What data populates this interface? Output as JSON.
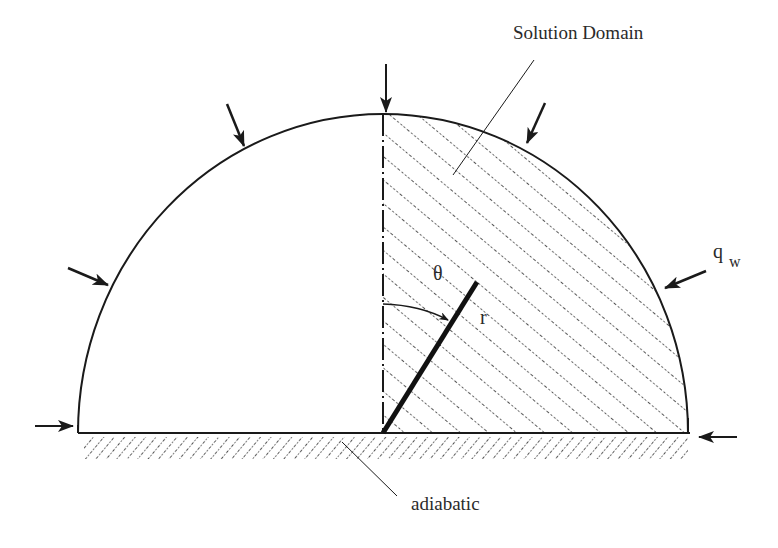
{
  "diagram": {
    "labels": {
      "solution_domain": "Solution Domain",
      "theta": "θ",
      "r": "r",
      "q": "q",
      "w": "w",
      "adiabatic": "adiabatic"
    },
    "colors": {
      "stroke": "#1a1a1a",
      "hatch": "#2a2a2a",
      "background": "#ffffff"
    },
    "geometry": {
      "center": [
        383,
        433
      ],
      "rx": 305,
      "ry": 319
    }
  }
}
